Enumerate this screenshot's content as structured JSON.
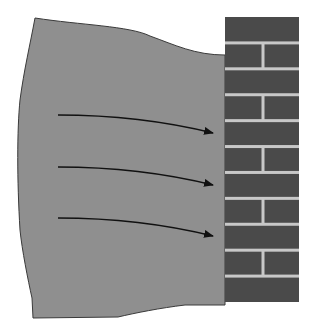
{
  "diagram": {
    "colors": {
      "background": "#ffffff",
      "mass_fill": "#8f8f8f",
      "mass_outline": "#3a3a3a",
      "brick": "#4a4a4a",
      "mortar": "#c8c8c8",
      "arrow": "#111111"
    },
    "mass": {
      "path": "M35,18 C80,25 130,26 150,36 C175,45 195,55 225,55 L225,305 L185,305 C160,308 135,313 118,317 L33,318 L32,298 C28,280 22,250 20,230 C17,180 17,130 20,100 C24,70 30,45 35,18 Z"
    },
    "wall": {
      "x": 225,
      "y": 17,
      "width": 74,
      "height": 285,
      "rows": 11,
      "mortar_width": 3,
      "joint_x": 263
    },
    "arrows": [
      {
        "x1": 58,
        "y1": 115,
        "cx": 140,
        "cy": 115,
        "x2": 213,
        "y2": 133
      },
      {
        "x1": 58,
        "y1": 167,
        "cx": 140,
        "cy": 167,
        "x2": 213,
        "y2": 185
      },
      {
        "x1": 58,
        "y1": 218,
        "cx": 140,
        "cy": 218,
        "x2": 213,
        "y2": 236
      }
    ],
    "icons": {
      "arrow": "force-arrow-icon",
      "wall": "brick-wall-icon"
    }
  }
}
